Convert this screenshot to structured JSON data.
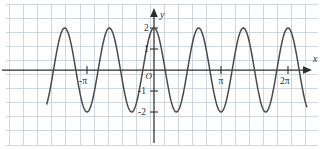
{
  "figure": {
    "width": 324,
    "height": 149,
    "background_color": "#ffffff",
    "grid_color": "#c2ccd6",
    "axis_color": "#2e2e2e",
    "curve_color": "#4a4a4a",
    "x_axis_name": "x",
    "y_axis_name": "y",
    "origin_label": "O"
  },
  "chart_data": {
    "type": "line",
    "title": "",
    "subtitle": "",
    "xlabel": "x",
    "ylabel": "y",
    "function": "y = 2cos(3x)",
    "amplitude": 2,
    "period_in_pi": 0.6667,
    "grid": true,
    "legend_position": "none",
    "xlim": [
      -1.6,
      2.28
    ],
    "ylim": [
      -2.5,
      2.5
    ],
    "xlim_unit": "pi",
    "x_tick_labels": [
      "-π",
      "π",
      "2π"
    ],
    "x_tick_values_in_pi": [
      -1,
      1,
      2
    ],
    "y_tick_labels": [
      "2",
      "1",
      "-1",
      "-2"
    ],
    "y_tick_values": [
      2,
      1,
      -1,
      -2
    ],
    "peaks_x_in_pi": [
      -1.3333,
      -0.6667,
      0,
      0.6667,
      1.3333,
      2
    ],
    "peaks_y": [
      2,
      2,
      2,
      2,
      2,
      2
    ],
    "troughs_x_in_pi": [
      -1.0,
      -0.3333,
      0.3333,
      1.0,
      1.6667
    ],
    "troughs_y": [
      -2,
      -2,
      -2,
      -2,
      -2
    ],
    "x": [
      -1.6,
      -1.5,
      -1.4,
      -1.3333,
      -1.25,
      -1.1667,
      -1.0833,
      -1.0,
      -0.9167,
      -0.8333,
      -0.75,
      -0.6667,
      -0.5833,
      -0.5,
      -0.4167,
      -0.3333,
      -0.25,
      -0.1667,
      -0.0833,
      0,
      0.0833,
      0.1667,
      0.25,
      0.3333,
      0.4167,
      0.5,
      0.5833,
      0.6667,
      0.75,
      0.8333,
      0.9167,
      1.0,
      1.0833,
      1.1667,
      1.25,
      1.3333,
      1.4167,
      1.5,
      1.5833,
      1.6667,
      1.75,
      1.8333,
      1.9167,
      2.0,
      2.0833,
      2.1667,
      2.28
    ],
    "y": [
      -1.0,
      0.0,
      1.0,
      2.0,
      1.41,
      0.0,
      -1.41,
      -2.0,
      -1.41,
      0.0,
      1.41,
      2.0,
      1.41,
      0.0,
      -1.41,
      -2.0,
      -1.41,
      0.0,
      1.41,
      2.0,
      1.41,
      0.0,
      -1.41,
      -2.0,
      -1.41,
      0.0,
      1.41,
      2.0,
      1.41,
      0.0,
      -1.41,
      -2.0,
      -1.41,
      0.0,
      1.41,
      2.0,
      1.41,
      0.0,
      -1.41,
      -2.0,
      -1.41,
      0.0,
      1.41,
      2.0,
      1.41,
      0.0,
      -1.3
    ]
  }
}
